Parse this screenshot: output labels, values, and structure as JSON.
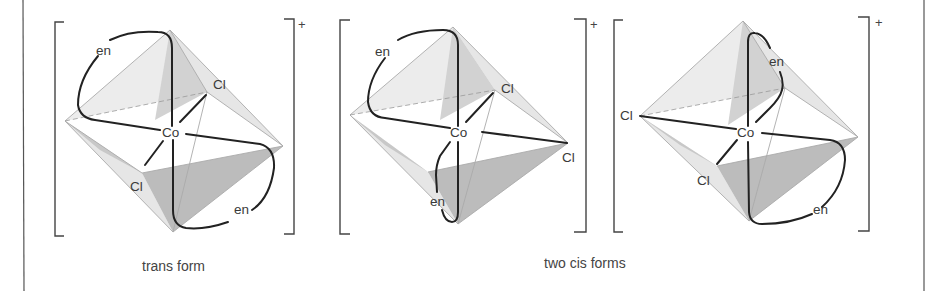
{
  "figure": {
    "charge": "+",
    "diagrams": [
      {
        "id": "trans",
        "center_label": "Co",
        "ligands": [
          "en",
          "en",
          "Cl",
          "Cl"
        ],
        "labels": {
          "en_top": "en",
          "en_bottom": "en",
          "cl_back": "Cl",
          "cl_front": "Cl",
          "co": "Co"
        }
      },
      {
        "id": "cis-1",
        "center_label": "Co",
        "ligands": [
          "en",
          "en",
          "Cl",
          "Cl"
        ],
        "labels": {
          "en_top": "en",
          "en_bottom": "en",
          "cl_back": "Cl",
          "cl_right": "Cl",
          "co": "Co"
        }
      },
      {
        "id": "cis-2",
        "center_label": "Co",
        "ligands": [
          "en",
          "en",
          "Cl",
          "Cl"
        ],
        "labels": {
          "en_top": "en",
          "en_bottom": "en",
          "cl_left": "Cl",
          "cl_front": "Cl",
          "co": "Co"
        }
      }
    ],
    "captions": {
      "trans": "trans form",
      "cis": "two cis forms"
    }
  }
}
